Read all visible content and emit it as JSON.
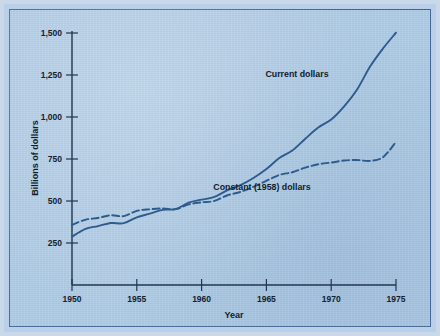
{
  "chart_data": {
    "type": "line",
    "title": "",
    "xlabel": "Year",
    "ylabel": "Billions of dollars",
    "xlim": [
      1950,
      1975
    ],
    "ylim": [
      0,
      1500
    ],
    "xticks": [
      "1950",
      "1955",
      "1960",
      "1965",
      "1970",
      "1975"
    ],
    "yticks": [
      "250",
      "500",
      "750",
      "1,000",
      "1,250",
      "1,500"
    ],
    "grid": false,
    "legend_position": "inline-annotation",
    "x": [
      1950,
      1951,
      1952,
      1953,
      1954,
      1955,
      1956,
      1957,
      1958,
      1959,
      1960,
      1961,
      1962,
      1963,
      1964,
      1965,
      1966,
      1967,
      1968,
      1969,
      1970,
      1971,
      1972,
      1973,
      1974,
      1975
    ],
    "series": [
      {
        "name": "Current dollars",
        "style": "solid",
        "color": "#2d5b8e",
        "values": [
          285,
          330,
          348,
          366,
          365,
          400,
          421,
          444,
          448,
          486,
          504,
          520,
          560,
          590,
          632,
          685,
          750,
          794,
          864,
          930,
          977,
          1055,
          1155,
          1290,
          1397,
          1490
        ]
      },
      {
        "name": "Constant (1958) dollars",
        "style": "dashed",
        "color": "#2d5b8e",
        "values": [
          355,
          385,
          396,
          412,
          407,
          438,
          447,
          452,
          448,
          476,
          488,
          497,
          530,
          550,
          580,
          615,
          650,
          666,
          693,
          713,
          723,
          735,
          738,
          733,
          755,
          845
        ]
      }
    ],
    "annotations": [
      {
        "text": "Current dollars",
        "x": 1968.2,
        "y": 1230
      },
      {
        "text": "Constant (1958) dollars",
        "x": 1964.5,
        "y": 560
      }
    ]
  },
  "axes": {
    "y_title": "Billions of dollars",
    "x_title": "Year"
  }
}
